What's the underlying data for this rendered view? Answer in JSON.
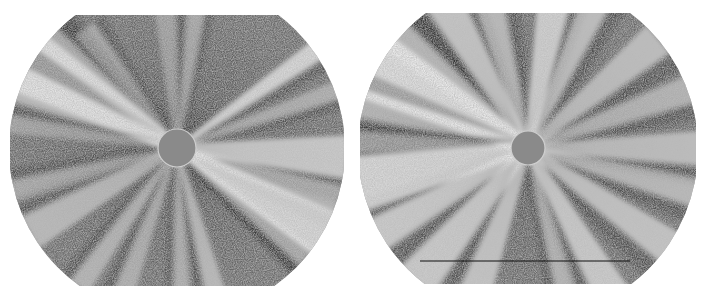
{
  "figure": {
    "panels": [
      {
        "id": "left",
        "x": 10,
        "y": 15,
        "width": 334,
        "height": 271,
        "circle": {
          "cx": 167,
          "cy": 134,
          "r": 168
        },
        "disk": {
          "cx": 167,
          "cy": 133,
          "r": 19
        },
        "rays": [
          {
            "angle": -150,
            "len": 170,
            "w": 18,
            "o": 0.75
          },
          {
            "angle": -158,
            "len": 170,
            "w": 10,
            "o": 0.55
          },
          {
            "angle": -140,
            "len": 170,
            "w": 8,
            "o": 0.5
          },
          {
            "angle": -128,
            "len": 150,
            "w": 6,
            "o": 0.4
          },
          {
            "angle": -95,
            "len": 150,
            "w": 6,
            "o": 0.35
          },
          {
            "angle": -82,
            "len": 160,
            "w": 5,
            "o": 0.4
          },
          {
            "angle": -35,
            "len": 180,
            "w": 6,
            "o": 0.8
          },
          {
            "angle": -20,
            "len": 170,
            "w": 5,
            "o": 0.45
          },
          {
            "angle": 3,
            "len": 170,
            "w": 12,
            "o": 0.7
          },
          {
            "angle": 18,
            "len": 170,
            "w": 8,
            "o": 0.5
          },
          {
            "angle": 30,
            "len": 180,
            "w": 14,
            "o": 0.8
          },
          {
            "angle": 40,
            "len": 170,
            "w": 6,
            "o": 0.5
          },
          {
            "angle": 75,
            "len": 170,
            "w": 6,
            "o": 0.55
          },
          {
            "angle": 88,
            "len": 170,
            "w": 5,
            "o": 0.45
          },
          {
            "angle": 110,
            "len": 170,
            "w": 6,
            "o": 0.45
          },
          {
            "angle": 125,
            "len": 170,
            "w": 6,
            "o": 0.5
          },
          {
            "angle": 150,
            "len": 170,
            "w": 10,
            "o": 0.55
          },
          {
            "angle": 165,
            "len": 170,
            "w": 6,
            "o": 0.4
          },
          {
            "angle": -172,
            "len": 170,
            "w": 5,
            "o": 0.35
          }
        ]
      },
      {
        "id": "right",
        "x": 360,
        "y": 13,
        "width": 336,
        "height": 271,
        "circle": {
          "cx": 168,
          "cy": 136,
          "r": 170
        },
        "disk": {
          "cx": 168,
          "cy": 135,
          "r": 17
        },
        "rays": [
          {
            "angle": -152,
            "len": 180,
            "w": 20,
            "o": 0.85
          },
          {
            "angle": -140,
            "len": 180,
            "w": 10,
            "o": 0.6
          },
          {
            "angle": -165,
            "len": 180,
            "w": 8,
            "o": 0.5
          },
          {
            "angle": -120,
            "len": 170,
            "w": 10,
            "o": 0.65
          },
          {
            "angle": -105,
            "len": 160,
            "w": 8,
            "o": 0.55
          },
          {
            "angle": -80,
            "len": 170,
            "w": 10,
            "o": 0.75
          },
          {
            "angle": -65,
            "len": 170,
            "w": 8,
            "o": 0.6
          },
          {
            "angle": -40,
            "len": 170,
            "w": 10,
            "o": 0.6
          },
          {
            "angle": -20,
            "len": 180,
            "w": 8,
            "o": 0.5
          },
          {
            "angle": 0,
            "len": 180,
            "w": 10,
            "o": 0.6
          },
          {
            "angle": 15,
            "len": 180,
            "w": 8,
            "o": 0.55
          },
          {
            "angle": 35,
            "len": 180,
            "w": 10,
            "o": 0.65
          },
          {
            "angle": 60,
            "len": 180,
            "w": 10,
            "o": 0.7
          },
          {
            "angle": 75,
            "len": 170,
            "w": 6,
            "o": 0.5
          },
          {
            "angle": 110,
            "len": 180,
            "w": 10,
            "o": 0.65
          },
          {
            "angle": 130,
            "len": 180,
            "w": 12,
            "o": 0.7
          },
          {
            "angle": 150,
            "len": 180,
            "w": 10,
            "o": 0.7
          },
          {
            "angle": 168,
            "len": 180,
            "w": 16,
            "o": 0.8
          },
          {
            "angle": -178,
            "len": 180,
            "w": 6,
            "o": 0.4
          }
        ],
        "artifact_line": {
          "x1": 60,
          "x2": 270,
          "y": 248
        }
      }
    ],
    "colors": {
      "background": "#ffffff",
      "sky": "#5a5a5a",
      "sky_dark": "#2e2e2e",
      "streamer": "#f2f2f2",
      "disk": "#8a8a8a"
    }
  }
}
